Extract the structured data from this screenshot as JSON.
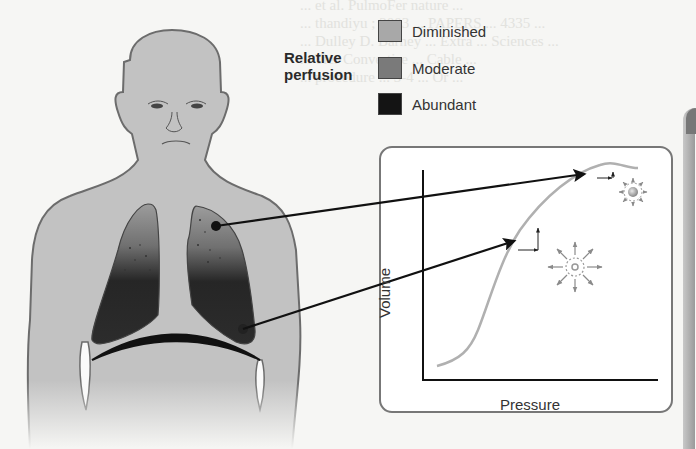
{
  "figure": {
    "background_text_lines": [
      "... et al. PulmoFer nature ...",
      "... thandiyu ; 2003 ... PAPERS ... 4335 ...",
      "... Dulley D. Barney ... Extra ... Sciences ...",
      "... Tier Convertise ... Cable ...",
      "... procedure ... 3-4 ... Or ..."
    ],
    "legend": {
      "title_line1": "Relative",
      "title_line2": "perfusion",
      "items": [
        {
          "label": "Diminished",
          "color": "#a8a8a8"
        },
        {
          "label": "Moderate",
          "color": "#7a7a7a"
        },
        {
          "label": "Abundant",
          "color": "#141414"
        }
      ]
    },
    "body": {
      "skin_color": "#c2c2c2",
      "outline_color": "#6c6c6c",
      "lung_top_color": "#9a9a9a",
      "lung_bottom_color": "#1e1e1e"
    },
    "inset": {
      "x_axis_label": "Pressure",
      "y_axis_label": "Volume",
      "curve_color": "#b0b0b0",
      "annotations": [
        {
          "name": "apex-alveolus",
          "description": "small compliance change near top of curve, large alveolus"
        },
        {
          "name": "base-alveolus",
          "description": "large compliance change on steep part of curve, small expanding alveolus"
        }
      ]
    },
    "pointers": [
      {
        "from": "upper-lung-apex",
        "to": "curve-upper-flat"
      },
      {
        "from": "lower-lung-base",
        "to": "curve-steep-mid"
      }
    ]
  }
}
